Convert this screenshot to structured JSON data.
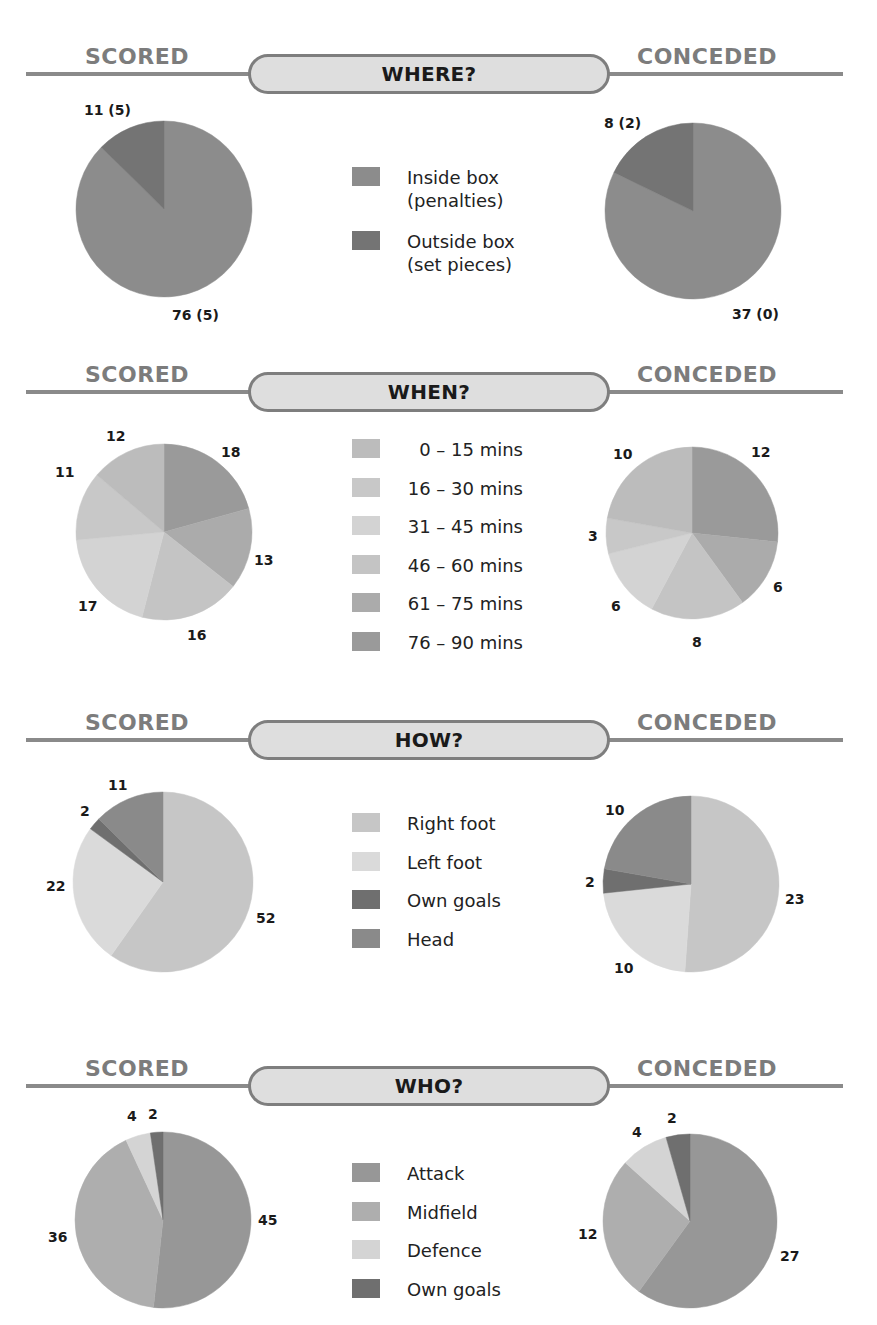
{
  "labels": {
    "scored": "SCORED",
    "conceded": "CONCEDED"
  },
  "chart_data": [
    {
      "type": "pie",
      "title": "WHERE?",
      "top": 50,
      "legend": [
        {
          "label": "Inside box\n(penalties)",
          "color": "#8c8c8c"
        },
        {
          "label": "Outside box\n(set pieces)",
          "color": "#747474"
        }
      ],
      "scored": {
        "slices": [
          {
            "category": "Inside box",
            "value": 76,
            "label": "76 (5)",
            "color": "#8c8c8c"
          },
          {
            "category": "Outside box",
            "value": 11,
            "label": "11 (5)",
            "color": "#747474"
          }
        ],
        "cx": 164,
        "cy": 209,
        "r": 88,
        "label_pos": [
          [
            172,
            307
          ],
          [
            84,
            102
          ]
        ]
      },
      "conceded": {
        "slices": [
          {
            "category": "Inside box",
            "value": 37,
            "label": "37 (0)",
            "color": "#8c8c8c"
          },
          {
            "category": "Outside box",
            "value": 8,
            "label": "8 (2)",
            "color": "#747474"
          }
        ],
        "cx": 693,
        "cy": 211,
        "r": 88,
        "label_pos": [
          [
            732,
            306
          ],
          [
            604,
            115
          ]
        ]
      }
    },
    {
      "type": "pie",
      "title": "WHEN?",
      "top": 368,
      "legend": [
        {
          "label": "0 – 15 mins",
          "color": "#bcbcbc"
        },
        {
          "label": "16 – 30 mins",
          "color": "#c8c8c8"
        },
        {
          "label": "31 – 45 mins",
          "color": "#d3d3d3"
        },
        {
          "label": "46 – 60 mins",
          "color": "#c4c4c4"
        },
        {
          "label": "61 – 75 mins",
          "color": "#ababab"
        },
        {
          "label": "76 – 90 mins",
          "color": "#9a9a9a"
        }
      ],
      "scored": {
        "slices": [
          {
            "category": "76 – 90 mins",
            "value": 18,
            "label": "18",
            "color": "#9a9a9a"
          },
          {
            "category": "61 – 75 mins",
            "value": 13,
            "label": "13",
            "color": "#ababab"
          },
          {
            "category": "46 – 60 mins",
            "value": 16,
            "label": "16",
            "color": "#c4c4c4"
          },
          {
            "category": "31 – 45 mins",
            "value": 17,
            "label": "17",
            "color": "#d3d3d3"
          },
          {
            "category": "16 – 30 mins",
            "value": 11,
            "label": "11",
            "color": "#c8c8c8"
          },
          {
            "category": "0 – 15 mins",
            "value": 12,
            "label": "12",
            "color": "#bcbcbc"
          }
        ],
        "cx": 164,
        "cy": 532,
        "r": 88,
        "label_pos": [
          [
            221,
            444
          ],
          [
            254,
            552
          ],
          [
            187,
            627
          ],
          [
            78,
            598
          ],
          [
            55,
            464
          ],
          [
            106,
            428
          ]
        ]
      },
      "conceded": {
        "slices": [
          {
            "category": "76 – 90 mins",
            "value": 12,
            "label": "12",
            "color": "#9a9a9a"
          },
          {
            "category": "61 – 75 mins",
            "value": 6,
            "label": "6",
            "color": "#ababab"
          },
          {
            "category": "46 – 60 mins",
            "value": 8,
            "label": "8",
            "color": "#c4c4c4"
          },
          {
            "category": "31 – 45 mins",
            "value": 6,
            "label": "6",
            "color": "#d3d3d3"
          },
          {
            "category": "16 – 30 mins",
            "value": 3,
            "label": "3",
            "color": "#c8c8c8"
          },
          {
            "category": "0 – 15 mins",
            "value": 10,
            "label": "10",
            "color": "#bcbcbc"
          }
        ],
        "cx": 692,
        "cy": 533,
        "r": 86,
        "label_pos": [
          [
            751,
            444
          ],
          [
            773,
            579
          ],
          [
            692,
            634
          ],
          [
            611,
            598
          ],
          [
            588,
            528
          ],
          [
            613,
            446
          ]
        ]
      }
    },
    {
      "type": "pie",
      "title": "HOW?",
      "top": 716,
      "legend": [
        {
          "label": "Right foot",
          "color": "#c6c6c6"
        },
        {
          "label": "Left foot",
          "color": "#dadada"
        },
        {
          "label": "Own goals",
          "color": "#6f6f6f"
        },
        {
          "label": "Head",
          "color": "#8a8a8a"
        }
      ],
      "scored": {
        "slices": [
          {
            "category": "Right foot",
            "value": 52,
            "label": "52",
            "color": "#c6c6c6"
          },
          {
            "category": "Left foot",
            "value": 22,
            "label": "22",
            "color": "#dadada"
          },
          {
            "category": "Own goals",
            "value": 2,
            "label": "2",
            "color": "#6f6f6f"
          },
          {
            "category": "Head",
            "value": 11,
            "label": "11",
            "color": "#8a8a8a"
          }
        ],
        "cx": 163,
        "cy": 882,
        "r": 90,
        "label_pos": [
          [
            256,
            910
          ],
          [
            46,
            878
          ],
          [
            80,
            803
          ],
          [
            108,
            777
          ]
        ]
      },
      "conceded": {
        "slices": [
          {
            "category": "Right foot",
            "value": 23,
            "label": "23",
            "color": "#c6c6c6"
          },
          {
            "category": "Left foot",
            "value": 10,
            "label": "10",
            "color": "#dadada"
          },
          {
            "category": "Own goals",
            "value": 2,
            "label": "2",
            "color": "#6f6f6f"
          },
          {
            "category": "Head",
            "value": 10,
            "label": "10",
            "color": "#8a8a8a"
          }
        ],
        "cx": 691,
        "cy": 884,
        "r": 88,
        "label_pos": [
          [
            785,
            891
          ],
          [
            614,
            960
          ],
          [
            585,
            874
          ],
          [
            605,
            802
          ]
        ]
      }
    },
    {
      "type": "pie",
      "title": "WHO?",
      "top": 1062,
      "legend": [
        {
          "label": "Attack",
          "color": "#979797"
        },
        {
          "label": "Midfield",
          "color": "#aeaeae"
        },
        {
          "label": "Defence",
          "color": "#d4d4d4"
        },
        {
          "label": "Own goals",
          "color": "#6f6f6f"
        }
      ],
      "scored": {
        "slices": [
          {
            "category": "Attack",
            "value": 45,
            "label": "45",
            "color": "#979797"
          },
          {
            "category": "Midfield",
            "value": 36,
            "label": "36",
            "color": "#aeaeae"
          },
          {
            "category": "Defence",
            "value": 4,
            "label": "4",
            "color": "#d4d4d4"
          },
          {
            "category": "Own goals",
            "value": 2,
            "label": "2",
            "color": "#6f6f6f"
          }
        ],
        "cx": 163,
        "cy": 1220,
        "r": 88,
        "label_pos": [
          [
            258,
            1212
          ],
          [
            48,
            1229
          ],
          [
            127,
            1108
          ],
          [
            148,
            1106
          ]
        ]
      },
      "conceded": {
        "slices": [
          {
            "category": "Attack",
            "value": 27,
            "label": "27",
            "color": "#979797"
          },
          {
            "category": "Midfield",
            "value": 12,
            "label": "12",
            "color": "#aeaeae"
          },
          {
            "category": "Defence",
            "value": 4,
            "label": "4",
            "color": "#d4d4d4"
          },
          {
            "category": "Own goals",
            "value": 2,
            "label": "2",
            "color": "#6f6f6f"
          }
        ],
        "cx": 690,
        "cy": 1221,
        "r": 87,
        "label_pos": [
          [
            780,
            1248
          ],
          [
            578,
            1226
          ],
          [
            632,
            1124
          ],
          [
            667,
            1110
          ]
        ]
      }
    }
  ]
}
